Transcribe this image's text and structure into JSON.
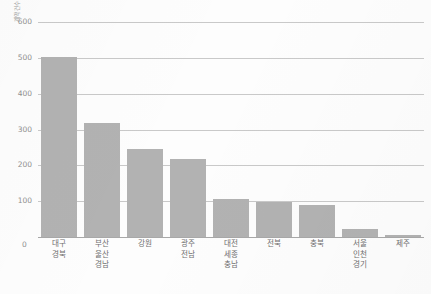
{
  "chart_data": {
    "type": "bar",
    "title": "",
    "xlabel": "",
    "ylabel": "계약건수",
    "ylim": [
      0,
      600
    ],
    "yticks": [
      0,
      100,
      200,
      300,
      400,
      500,
      600
    ],
    "grid": true,
    "legend": "none",
    "bar_color": "#b2b2b2",
    "gridline_color": "#c9c9c9",
    "categories": [
      "대구\n경북",
      "부산\n울산\n경남",
      "강원",
      "광주\n전남",
      "대전\n세종\n충남",
      "전북",
      "충북",
      "서울\n인천\n경기",
      "제주"
    ],
    "category_lines": [
      [
        "대구",
        "경북"
      ],
      [
        "부산",
        "울산",
        "경남"
      ],
      [
        "강원"
      ],
      [
        "광주",
        "전남"
      ],
      [
        "대전",
        "세종",
        "충남"
      ],
      [
        "전북"
      ],
      [
        "충북"
      ],
      [
        "서울",
        "인천",
        "경기"
      ],
      [
        "제주"
      ]
    ],
    "values": [
      503,
      318,
      247,
      218,
      105,
      99,
      88,
      22,
      6
    ]
  },
  "axis": {
    "y_title": "계약건수",
    "zero_label": "0",
    "tick_labels": [
      "100",
      "200",
      "300",
      "400",
      "500",
      "600"
    ]
  }
}
